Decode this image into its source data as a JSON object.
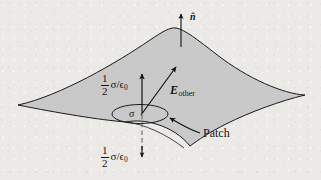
{
  "figure": {
    "name": "electric-field-at-a-patch-of-charged-surface",
    "background_color": "#eceae7",
    "surface_fill": "#c9c9c9",
    "stroke_color": "#1a1a1a"
  },
  "labels": {
    "normal_vector": "n̂",
    "field_other": "E",
    "field_other_subscript": "other",
    "patch": "Patch",
    "surface_charge_density": "σ",
    "flux_numerator": "1",
    "flux_denominator": "2",
    "flux_expression": "σ/ϵ",
    "flux_expression_subscript": "0"
  },
  "annotations": {
    "upper_field_label_full": "1/2 σ/ϵ₀",
    "lower_field_label_full": "1/2 σ/ϵ₀"
  }
}
